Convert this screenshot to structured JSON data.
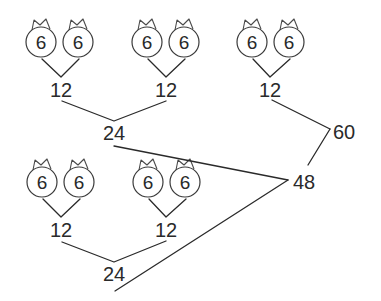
{
  "diagram": {
    "type": "factor-sum-tree",
    "colors": {
      "ink": "#2a2a2a",
      "background": "#ffffff"
    },
    "leaf_icon": "crowned-circle-icon",
    "groups": [
      {
        "id": "g1",
        "leaves": [
          "6",
          "6"
        ],
        "sum": "12"
      },
      {
        "id": "g2",
        "leaves": [
          "6",
          "6"
        ],
        "sum": "12"
      },
      {
        "id": "g3",
        "leaves": [
          "6",
          "6"
        ],
        "sum": "12"
      },
      {
        "id": "g4",
        "leaves": [
          "6",
          "6"
        ],
        "sum": "12"
      },
      {
        "id": "g5",
        "leaves": [
          "6",
          "6"
        ],
        "sum": "12"
      }
    ],
    "nodes": {
      "top_24": "24",
      "bottom_24": "24",
      "n48": "48",
      "n60": "60"
    },
    "edges": [
      {
        "from": "g1",
        "to": "top_24"
      },
      {
        "from": "g2",
        "to": "top_24"
      },
      {
        "from": "g4",
        "to": "bottom_24"
      },
      {
        "from": "g5",
        "to": "bottom_24"
      },
      {
        "from": "top_24",
        "to": "n48"
      },
      {
        "from": "bottom_24",
        "to": "n48"
      },
      {
        "from": "g3",
        "to": "n60"
      },
      {
        "from": "n48",
        "to": "n60"
      }
    ]
  }
}
